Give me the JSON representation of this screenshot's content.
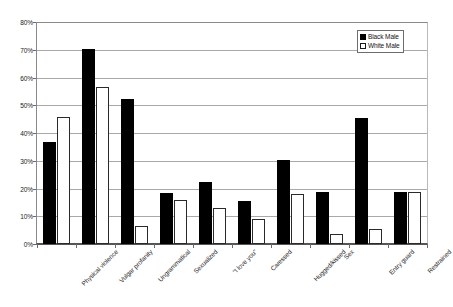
{
  "chart_data": {
    "type": "bar",
    "title": "",
    "subtitle": "",
    "xlabel": "",
    "ylabel": "",
    "ylim": [
      0,
      80
    ],
    "ytick_labels": [
      "80%",
      "70%",
      "60%",
      "50%",
      "40%",
      "30%",
      "20%",
      "10%",
      "0%"
    ],
    "ytick_values": [
      80,
      70,
      60,
      50,
      40,
      30,
      20,
      10,
      0
    ],
    "grid": true,
    "legend_position": "top-right",
    "categories": [
      "Physical violence",
      "Vulgar profanity",
      "Ungrammatical",
      "Sexualized",
      "\"I love you\"",
      "Caressed",
      "Hugged/kissed",
      "Sex",
      "Entry guard",
      "Restrained"
    ],
    "series": [
      {
        "name": "Black Male",
        "color": "#000000",
        "values": [
          37,
          70.5,
          52.5,
          18.5,
          22.5,
          15.5,
          30.5,
          19,
          45.5,
          19
        ]
      },
      {
        "name": "White Male",
        "color": "#ffffff",
        "values": [
          46,
          57,
          6.5,
          16,
          13,
          9,
          18,
          3.5,
          5.5,
          19
        ]
      }
    ]
  },
  "legend": {
    "items": [
      {
        "label": "Black Male",
        "swatch": "black"
      },
      {
        "label": "White Male",
        "swatch": "white"
      }
    ]
  }
}
